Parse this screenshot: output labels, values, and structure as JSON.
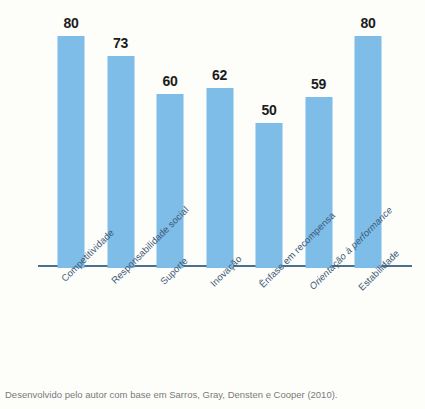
{
  "caption": "Desenvolvido pelo autor com base em Sarros, Gray, Densten e Cooper (2010).",
  "colors": {
    "bar": "#7dbde8",
    "axis": "#4a7090",
    "label": "#3d5a77",
    "value": "#1c1c1c",
    "caption": "#7a7a7a",
    "background": "#fdfdfa"
  },
  "chart_data": {
    "type": "bar",
    "title": "",
    "xlabel": "",
    "ylabel": "",
    "ylim": [
      0,
      92
    ],
    "grid": false,
    "legend": false,
    "categories": [
      "Competitividade",
      "Responsabilidade social",
      "Suporte",
      "Inovação",
      "Ênfase em recompensa",
      "Orientação à performance",
      "Estabilidade"
    ],
    "categories_italic": [
      false,
      false,
      false,
      false,
      false,
      true,
      false
    ],
    "values": [
      80,
      73,
      60,
      62,
      50,
      59,
      80
    ],
    "value_labels": [
      "80",
      "73",
      "60",
      "62",
      "50",
      "59",
      "80"
    ]
  }
}
